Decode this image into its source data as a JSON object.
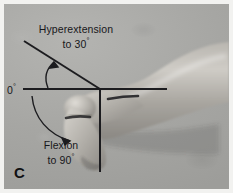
{
  "figure": {
    "panel_label": "C",
    "background_color": "#a8a8a6",
    "line_color": "#1c1c1f",
    "text_color": "#17171a",
    "border_color": "#f2f2f0"
  },
  "annotations": {
    "hyperextension": {
      "line1": "Hyperextension",
      "line2_text": "to 30",
      "degree_symbol": "°",
      "value": 30,
      "unit": "degrees",
      "arrow": "curved-arrow-up"
    },
    "flexion": {
      "line1": "Flexion",
      "line2_text": "to 90",
      "degree_symbol": "°",
      "value": 90,
      "unit": "degrees",
      "arrow": "curved-arrow-down"
    },
    "neutral": {
      "text": "0",
      "degree_symbol": "°",
      "value": 0,
      "unit": "degrees"
    }
  },
  "geometry": {
    "vertex": [
      100,
      89
    ],
    "horizontal_axis_end": [
      167,
      89
    ],
    "vertical_axis_end": [
      100,
      172
    ],
    "hyperextension_ray_end": [
      24,
      41
    ],
    "hyperextension_angle_deg": 30,
    "flexion_angle_deg": 90
  }
}
